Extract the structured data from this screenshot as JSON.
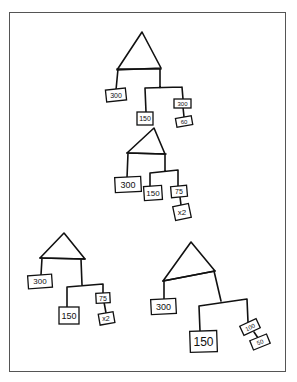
{
  "diagram": {
    "stroke_color": "#111111",
    "frame_color": "#555555",
    "trees": [
      {
        "id": "tree-top",
        "nodes": [
          {
            "label": "300"
          },
          {
            "label": "150"
          },
          {
            "label": "300"
          },
          {
            "label": "60"
          }
        ]
      },
      {
        "id": "tree-middle",
        "nodes": [
          {
            "label": "300"
          },
          {
            "label": "150"
          },
          {
            "label": "75"
          },
          {
            "label": "x2"
          }
        ]
      },
      {
        "id": "tree-bottom-left",
        "nodes": [
          {
            "label": "300"
          },
          {
            "label": "150"
          },
          {
            "label": "75"
          },
          {
            "label": "x2"
          }
        ]
      },
      {
        "id": "tree-bottom-right",
        "nodes": [
          {
            "label": "300"
          },
          {
            "label": "150"
          },
          {
            "label": "100"
          },
          {
            "label": "50"
          }
        ]
      }
    ]
  }
}
